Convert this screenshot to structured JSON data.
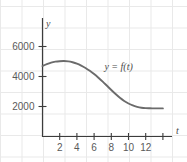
{
  "chart_data": {
    "type": "line",
    "title": "",
    "subtitle": "",
    "xlabel": "t",
    "ylabel": "y",
    "grid": true,
    "legend": "none",
    "annotations": [
      {
        "name": "curve-label",
        "text": "y = f(t)",
        "x": 7.2,
        "y": 4450
      }
    ],
    "xlim": [
      -0.9,
      16.5
    ],
    "ylim": [
      0,
      7200
    ],
    "xticks": [
      2,
      4,
      6,
      8,
      10,
      12
    ],
    "xtick_labels": [
      "2",
      "4",
      "6",
      "8",
      "10",
      "12"
    ],
    "yticks": [
      2000,
      4000,
      6000
    ],
    "ytick_labels": [
      "2000",
      "4000",
      "6000"
    ],
    "series": [
      {
        "name": "f(t)",
        "color": "#6b6b6b",
        "x": [
          0,
          0.5,
          1,
          1.5,
          2,
          2.5,
          3,
          3.5,
          4,
          4.5,
          5,
          5.5,
          6,
          6.5,
          7,
          7.5,
          8,
          8.5,
          9,
          9.5,
          10,
          10.5,
          11,
          11.5,
          12,
          12.5,
          13,
          13.5,
          14
        ],
        "values": [
          4700,
          4830,
          4930,
          4990,
          5020,
          5030,
          5010,
          4950,
          4860,
          4730,
          4570,
          4380,
          4160,
          3920,
          3660,
          3380,
          3100,
          2830,
          2580,
          2370,
          2200,
          2070,
          1980,
          1920,
          1890,
          1880,
          1875,
          1875,
          1875
        ]
      }
    ]
  },
  "axis": {
    "y_label": "y",
    "x_label": "t"
  },
  "colors": {
    "curve": "#6b6b6b",
    "axis": "#3c3c3c",
    "grid": "#e9e9e9",
    "tick_text": "#5a5a5a"
  }
}
